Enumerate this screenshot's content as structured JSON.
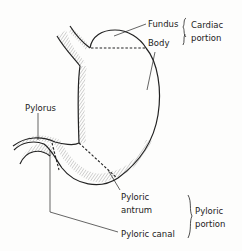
{
  "diagram": {
    "labels": {
      "fundus": "Fundus",
      "body": "Body",
      "cardiac_line1": "Cardiac",
      "cardiac_line2": "portion",
      "pylorus": "Pylorus",
      "pyloric_antrum_line1": "Pyloric",
      "pyloric_antrum_line2": "antrum",
      "pyloric_canal": "Pyloric canal",
      "pyloric_portion_line1": "Pyloric",
      "pyloric_portion_line2": "portion"
    },
    "colors": {
      "outline": "#222222",
      "background": "#fdfdfc"
    }
  }
}
